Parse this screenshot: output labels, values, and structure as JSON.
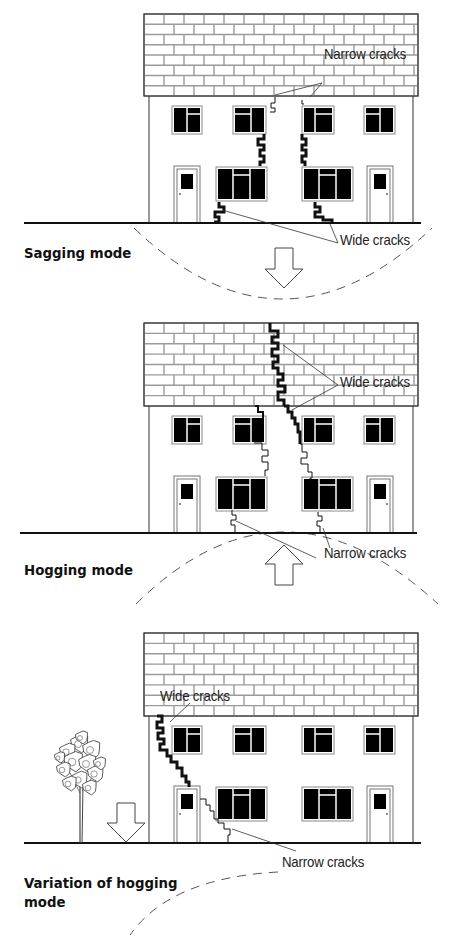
{
  "figure": {
    "colors": {
      "line": "#111111",
      "roof_mortar": "#9a9a9a",
      "window_fill": "#000000",
      "window_frame": "#8a8a8a",
      "background": "#ffffff"
    },
    "panels": [
      {
        "id": "sagging",
        "mode_label": "Sagging mode",
        "mode_label_pos": [
          24,
          244
        ],
        "house": {
          "x": 144,
          "roof_top": 14,
          "roof_bottom": 96,
          "ground": 223,
          "wall_left": 149,
          "wall_right": 413,
          "roof_right": 418
        },
        "ground_line": [
          24,
          421
        ],
        "arrow": {
          "direction": "down",
          "x": 284,
          "top": 248,
          "bottom": 288
        },
        "arc": {
          "type": "sag",
          "path": "M134,228 Q 282,370 432,228"
        },
        "callouts": [
          {
            "text": "Narrow cracks",
            "x": 324,
            "y": 73,
            "lines": [
              [
                322,
                83,
                275,
                95
              ],
              [
                322,
                83,
                310,
                97
              ]
            ]
          },
          {
            "text": "Wide cracks",
            "x": 340,
            "y": 231,
            "lines": [
              [
                338,
                243,
                222,
                210
              ],
              [
                338,
                243,
                330,
                224
              ]
            ]
          }
        ],
        "cracks": [
          {
            "width": 1,
            "points": "275,97 275,103 271,103 271,108 275,108 275,112 270,112"
          },
          {
            "width": 3,
            "points": "264,134 264,139 258,139 258,145 264,145 264,150 260,150 260,156 264,156 264,162 260,162 260,166"
          },
          {
            "width": 1,
            "points": "302,100 302,104 304,104"
          },
          {
            "width": 3,
            "points": "302,134 302,139 306,139 306,145 302,145 302,150 306,150 306,156 302,156 302,162 305,162 305,166"
          },
          {
            "width": 3,
            "points": "219,202 219,207 224,207 224,212 215,212 215,217 219,217 219,222 214,222"
          },
          {
            "width": 3,
            "points": "315,202 315,207 320,207 320,212 315,212 315,217 323,217 323,220 332,220 332,223"
          }
        ]
      },
      {
        "id": "hogging",
        "mode_label": "Hogging mode",
        "mode_label_pos": [
          24,
          561
        ],
        "house": {
          "x": 144,
          "roof_top": 323,
          "roof_bottom": 406,
          "ground": 533,
          "wall_left": 149,
          "wall_right": 413,
          "roof_right": 418
        },
        "ground_line": [
          20,
          417
        ],
        "arrow": {
          "direction": "up",
          "x": 284,
          "top": 545,
          "bottom": 585
        },
        "arc": {
          "type": "hog",
          "path": "M136,604 Q 282,460 438,604"
        },
        "callouts": [
          {
            "text": "Wide cracks",
            "x": 340,
            "y": 373,
            "lines": [
              [
                338,
                385,
                283,
                345
              ],
              [
                338,
                385,
                292,
                410
              ]
            ]
          },
          {
            "text": "Narrow cracks",
            "x": 324,
            "y": 544,
            "lines": [
              [
                316,
                558,
                236,
                521
              ],
              [
                330,
                548,
                323,
                528
              ]
            ]
          }
        ],
        "cracks": [
          {
            "width": 3,
            "points": "270,323 270,331 278,331 278,337 272,337 272,343 278,343 278,349 272,349 272,356 278,356 278,362 273,362 273,368 278,368 278,374 283,374 283,380 278,380 278,386 285,386 285,392 278,392 278,400 284,400 284,406"
          },
          {
            "width": 3,
            "points": "284,406 288,406 288,412 292,412 292,418 295,418 295,424 298,424 298,432 300,432 300,444"
          },
          {
            "width": 1,
            "points": "300,444 302,444 302,452 307,452 307,458 301,458 301,464 308,464 308,472 312,472 312,478 310,478 310,482"
          },
          {
            "width": 2,
            "points": "255,406 258,406 258,412 263,412 263,418"
          },
          {
            "width": 1,
            "points": "254,443 262,443 262,450 268,450 268,456 262,456 262,462 268,462 268,470 265,470 265,476"
          },
          {
            "width": 1,
            "points": "232,510 232,515 236,515 236,520 231,520 231,525 235,525 235,533"
          },
          {
            "width": 1,
            "points": "318,512 318,516 322,516 322,521 317,521 317,526 320,526 320,533"
          }
        ]
      },
      {
        "id": "variation",
        "mode_label": "Variation of hogging mode",
        "mode_label_lines": [
          "Variation of hogging",
          "mode"
        ],
        "mode_label_pos": [
          24,
          874
        ],
        "house": {
          "x": 144,
          "roof_top": 633,
          "roof_bottom": 716,
          "ground": 843,
          "wall_left": 149,
          "wall_right": 413,
          "roof_right": 418
        },
        "ground_line": [
          24,
          421
        ],
        "arrow": {
          "direction": "down",
          "x": 126,
          "top": 803,
          "bottom": 842
        },
        "arc": {
          "type": "edge",
          "path": "M278,872 Q 170,878 130,935"
        },
        "tree": {
          "x": 80,
          "base": 843,
          "crown_top": 733
        },
        "callouts": [
          {
            "text": "Wide cracks",
            "x": 160,
            "y": 687,
            "lines": [
              [
                190,
                703,
                170,
                722
              ]
            ]
          },
          {
            "text": "Narrow cracks",
            "x": 282,
            "y": 862,
            "lines": [
              [
                296,
                851,
                232,
                829
              ]
            ]
          }
        ],
        "cracks": [
          {
            "width": 3,
            "points": "157,716 162,716 162,722 157,722 157,728 163,728 163,733 158,733 158,739 164,739 164,744 160,744 160,750 167,750 167,756 171,756 171,762 177,762 177,768 182,768 182,776 186,776 186,782 189,782 189,787"
          },
          {
            "width": 1,
            "points": "200,799 206,799 206,805 210,805 210,811 214,811 214,819 218,819 218,823 224,823 224,829 230,829 230,835 228,835 228,843"
          }
        ]
      }
    ],
    "house_layout": {
      "upper_windows": [
        {
          "x": 172,
          "y_off": 10,
          "w": 30,
          "h": 28,
          "mullion": 0.5,
          "transom_side": "right"
        },
        {
          "x": 233,
          "y_off": 10,
          "w": 33,
          "h": 28,
          "mullion": 0.55,
          "transom_side": "left"
        },
        {
          "x": 302,
          "y_off": 10,
          "w": 32,
          "h": 28,
          "mullion": 0.4,
          "transom_side": "right"
        },
        {
          "x": 364,
          "y_off": 10,
          "w": 31,
          "h": 28,
          "mullion": 0.5,
          "transom_side": "left"
        }
      ],
      "lower_windows": [
        {
          "x": 216,
          "y_off": 71,
          "w": 51,
          "h": 34
        },
        {
          "x": 302,
          "y_off": 71,
          "w": 51,
          "h": 34
        }
      ],
      "doors": [
        {
          "x": 174,
          "y_off": 70,
          "w": 26,
          "h": 57,
          "knob": "left"
        },
        {
          "x": 367,
          "y_off": 70,
          "w": 26,
          "h": 57,
          "knob": "right"
        }
      ]
    }
  }
}
